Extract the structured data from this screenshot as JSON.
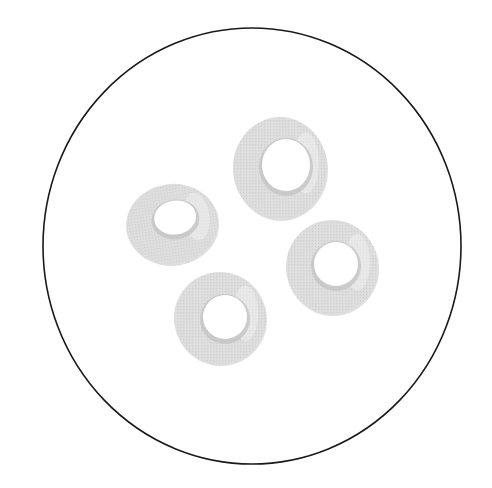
{
  "canvas": {
    "width": 492,
    "height": 488,
    "background": "#ffffff"
  },
  "field_of_view": {
    "shape": "circle",
    "cx": 252,
    "cy": 246,
    "rx": 209,
    "ry": 218,
    "stroke": "#1a1a1a",
    "stroke_width": 1.6,
    "fill": "#ffffff"
  },
  "cell_style": {
    "fill": "#d9d9d9",
    "fill_light": "#e6e6e6",
    "rim_shadow": "#c4c4c4",
    "highlight": "#f2f2f2",
    "hole_fill": "#ffffff"
  },
  "cells": [
    {
      "name": "cell-left",
      "cx": 172,
      "cy": 224,
      "rx": 46,
      "ry": 40,
      "rot": -8,
      "hole_cx": 176,
      "hole_cy": 218,
      "hole_rx": 21,
      "hole_ry": 17
    },
    {
      "name": "cell-top",
      "cx": 280,
      "cy": 168,
      "rx": 47,
      "ry": 51,
      "rot": 0,
      "hole_cx": 286,
      "hole_cy": 165,
      "hole_rx": 24,
      "hole_ry": 26
    },
    {
      "name": "cell-right",
      "cx": 332,
      "cy": 267,
      "rx": 46,
      "ry": 47,
      "rot": 0,
      "hole_cx": 336,
      "hole_cy": 264,
      "hole_rx": 22,
      "hole_ry": 22
    },
    {
      "name": "cell-bottom",
      "cx": 220,
      "cy": 318,
      "rx": 46,
      "ry": 46,
      "rot": 0,
      "hole_cx": 225,
      "hole_cy": 317,
      "hole_rx": 22,
      "hole_ry": 22
    }
  ]
}
